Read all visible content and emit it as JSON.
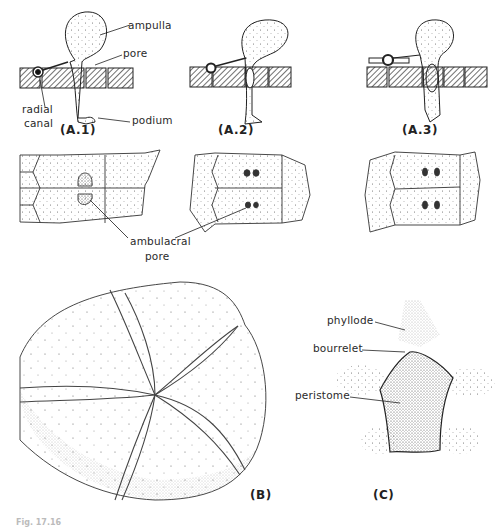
{
  "figure": {
    "panels": {
      "a1": "(A.1)",
      "a2": "(A.2)",
      "a3": "(A.3)",
      "b": "(B)",
      "c": "(C)"
    },
    "labels": {
      "ampulla": "ampulla",
      "pore": "pore",
      "radial_canal_1": "radial",
      "radial_canal_2": "canal",
      "podium": "podium",
      "ambulacral_pore_1": "ambulacral",
      "ambulacral_pore_2": "pore",
      "phyllode": "phyllode",
      "bourrelet": "bourrelet",
      "peristome": "peristome"
    },
    "caption_fragment": "Fig. 17.16"
  }
}
